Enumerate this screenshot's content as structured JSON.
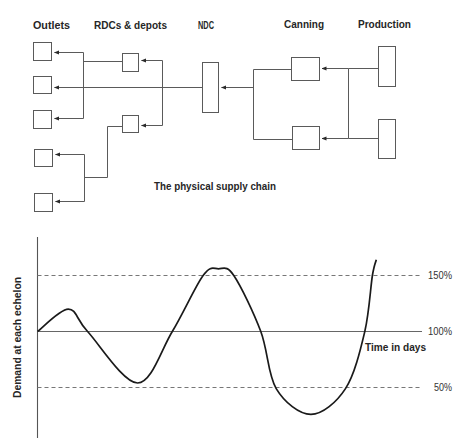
{
  "diagram": {
    "title": "The physical supply chain",
    "columns": {
      "outlets": "Outlets",
      "rdcs": "RDCs & depots",
      "ndc": "NDC",
      "canning": "Canning",
      "production": "Production"
    },
    "flow_direction": "Production → Canning → NDC → RDCs & depots → Outlets"
  },
  "chart_data": {
    "type": "line",
    "title": "",
    "xlabel": "Time in days",
    "ylabel": "Demand at each echelon",
    "grid": false,
    "legend": null,
    "xlim": [
      0,
      100
    ],
    "ylim": [
      5,
      184
    ],
    "reference_lines": [
      {
        "value": 150,
        "label": "150%",
        "style": "dashed"
      },
      {
        "value": 100,
        "label": "100%",
        "style": "solid"
      },
      {
        "value": 50,
        "label": "50%",
        "style": "dashed"
      }
    ],
    "x": [
      0,
      8,
      13,
      26,
      35,
      43,
      47,
      51,
      58,
      62,
      71,
      80,
      85,
      87,
      88
    ],
    "series": [
      {
        "name": "Demand (% of average)",
        "values": [
          100,
          120,
          100,
          54,
          100,
          150,
          156,
          150,
          100,
          49,
          26,
          49,
          100,
          150,
          164
        ]
      }
    ]
  },
  "colors": {
    "line": "#5a5a5a",
    "curve": "#1a1a1a",
    "text": "#262626",
    "background": "#ffffff"
  }
}
